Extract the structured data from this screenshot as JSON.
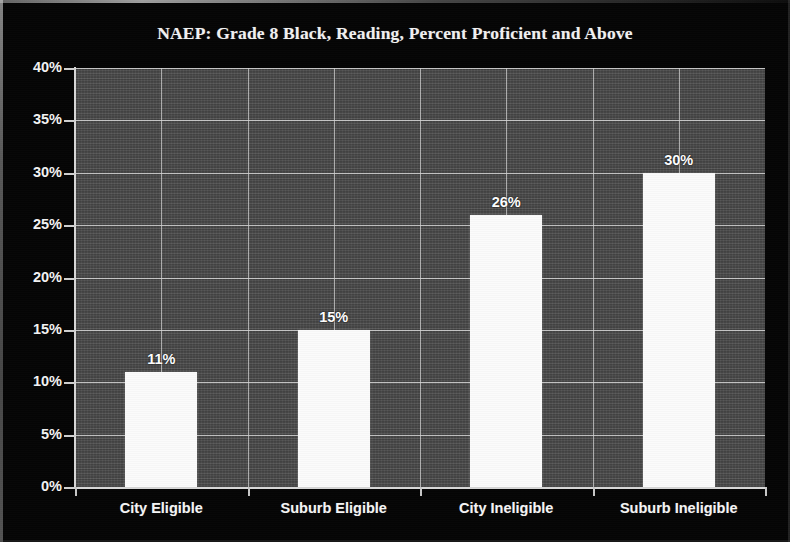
{
  "chart_data": {
    "type": "bar",
    "title": "NAEP: Grade 8 Black, Reading, Percent Proficient and Above",
    "categories": [
      "City Eligible",
      "Suburb Eligible",
      "City Ineligible",
      "Suburb Ineligible"
    ],
    "values": [
      11,
      15,
      26,
      30
    ],
    "data_labels": [
      "11%",
      "15%",
      "26%",
      "30%"
    ],
    "xlabel": "",
    "ylabel": "",
    "ylim": [
      0,
      40
    ],
    "ytick_step": 5,
    "ytick_labels": [
      "0%",
      "5%",
      "10%",
      "15%",
      "20%",
      "25%",
      "30%",
      "35%",
      "40%"
    ],
    "ytick_values": [
      0,
      5,
      10,
      15,
      20,
      25,
      30,
      35,
      40
    ],
    "grid": "both",
    "legend": "none",
    "colors": {
      "figure_background": "#050505",
      "plot_background": "#4a4a4a",
      "bar_fill": "#fbfbfb",
      "gridline": "#e0e0e0",
      "axis_line": "#d8d8d8",
      "text": "#f4f4f4"
    }
  }
}
